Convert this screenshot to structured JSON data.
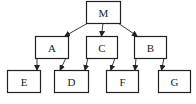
{
  "diagram": {
    "type": "directed-graph",
    "nodes": [
      {
        "id": "M",
        "label": "M",
        "x": 86,
        "y": 1,
        "w": 34,
        "h": 22
      },
      {
        "id": "A",
        "label": "A",
        "x": 35,
        "y": 36,
        "w": 33,
        "h": 22
      },
      {
        "id": "C",
        "label": "C",
        "x": 86,
        "y": 36,
        "w": 31,
        "h": 22
      },
      {
        "id": "B",
        "label": "B",
        "x": 134,
        "y": 36,
        "w": 32,
        "h": 22
      },
      {
        "id": "E",
        "label": "E",
        "x": 7,
        "y": 70,
        "w": 33,
        "h": 22
      },
      {
        "id": "D",
        "label": "D",
        "x": 54,
        "y": 70,
        "w": 34,
        "h": 22
      },
      {
        "id": "F",
        "label": "F",
        "x": 106,
        "y": 70,
        "w": 32,
        "h": 22
      },
      {
        "id": "G",
        "label": "G",
        "x": 158,
        "y": 70,
        "w": 32,
        "h": 22
      }
    ],
    "edges": [
      {
        "from": "M",
        "to": "A"
      },
      {
        "from": "M",
        "to": "C"
      },
      {
        "from": "M",
        "to": "B"
      },
      {
        "from": "A",
        "to": "E"
      },
      {
        "from": "A",
        "to": "D"
      },
      {
        "from": "C",
        "to": "D"
      },
      {
        "from": "C",
        "to": "F"
      },
      {
        "from": "B",
        "to": "F"
      },
      {
        "from": "B",
        "to": "G"
      }
    ],
    "colors": {
      "stroke": "#222222",
      "background": "#ffffff"
    }
  }
}
